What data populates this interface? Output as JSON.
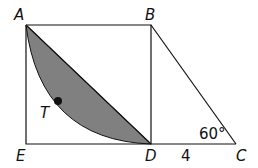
{
  "diagram": {
    "points": {
      "A": {
        "label": "A",
        "x": 26,
        "y": 25
      },
      "B": {
        "label": "B",
        "x": 151,
        "y": 25
      },
      "C": {
        "label": "C",
        "x": 236,
        "y": 144
      },
      "D": {
        "label": "D",
        "x": 151,
        "y": 144
      },
      "E": {
        "label": "E",
        "x": 26,
        "y": 144
      },
      "T": {
        "label": "T",
        "x": 58,
        "y": 101
      }
    },
    "angle_label": "60°",
    "length_label": "4",
    "colors": {
      "stroke": "#111111",
      "shade": "#808080"
    }
  }
}
